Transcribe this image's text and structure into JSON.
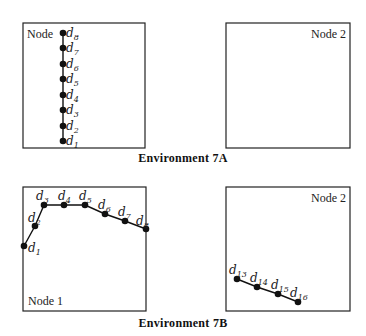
{
  "figure": {
    "environments": [
      {
        "caption": "Environment 7A",
        "panels": [
          {
            "node_label": "Node",
            "label_position": "top-left",
            "points": [
              {
                "name": "d",
                "sub": "1"
              },
              {
                "name": "d",
                "sub": "2"
              },
              {
                "name": "d",
                "sub": "3"
              },
              {
                "name": "d",
                "sub": "4"
              },
              {
                "name": "d",
                "sub": "5"
              },
              {
                "name": "d",
                "sub": "6"
              },
              {
                "name": "d",
                "sub": "7"
              },
              {
                "name": "d",
                "sub": "8"
              }
            ],
            "shape": "vertical-line"
          },
          {
            "node_label": "Node 2",
            "label_position": "top-right",
            "points": []
          }
        ]
      },
      {
        "caption": "Environment 7B",
        "panels": [
          {
            "node_label": "Node 1",
            "label_position": "bottom-left",
            "points": [
              {
                "name": "d",
                "sub": "1"
              },
              {
                "name": "d",
                "sub": "2"
              },
              {
                "name": "d",
                "sub": "3"
              },
              {
                "name": "d",
                "sub": "4"
              },
              {
                "name": "d",
                "sub": "5"
              },
              {
                "name": "d",
                "sub": "6"
              },
              {
                "name": "d",
                "sub": "7"
              },
              {
                "name": "d",
                "sub": "8"
              }
            ],
            "shape": "arch"
          },
          {
            "node_label": "Node 2",
            "label_position": "top-right",
            "points": [
              {
                "name": "d",
                "sub": "13"
              },
              {
                "name": "d",
                "sub": "14"
              },
              {
                "name": "d",
                "sub": "15"
              },
              {
                "name": "d",
                "sub": "16"
              }
            ],
            "shape": "descending-line"
          }
        ]
      }
    ]
  }
}
